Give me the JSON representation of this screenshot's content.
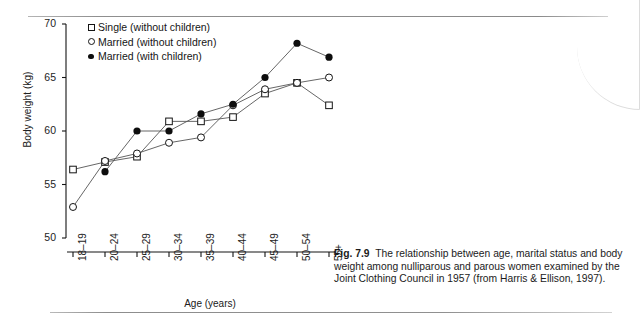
{
  "figure": {
    "number_label": "Fig. 7.9",
    "caption": "The relationship between age, marital status and body weight among nulliparous and parous women examined by the Joint Clothing Council in 1957 (from Harris & Ellison, 1997)."
  },
  "legend": {
    "position": "top-left-inside",
    "items": [
      {
        "marker": "open-square-marker",
        "label": "Single (without children)"
      },
      {
        "marker": "open-circle-marker",
        "label": "Married (without children)"
      },
      {
        "marker": "filled-circle-marker",
        "label": "Married (with children)"
      }
    ]
  },
  "chart_data": {
    "type": "line",
    "title": "",
    "xlabel": "Age (years)",
    "ylabel": "Body weight (kg)",
    "categories": [
      "18–19",
      "20–24",
      "25–29",
      "30–34",
      "35–39",
      "40–44",
      "45–49",
      "50–54",
      "55+"
    ],
    "ylim": [
      50,
      70
    ],
    "yticks": [
      50,
      55,
      60,
      65,
      70
    ],
    "ytick_labels": [
      "50",
      "55",
      "60",
      "65",
      "70"
    ],
    "grid": false,
    "legend_position": "upper left",
    "series": [
      {
        "name": "Single (without children)",
        "marker": "open-square",
        "values": [
          56.4,
          57.1,
          57.6,
          60.9,
          60.9,
          61.3,
          63.5,
          64.5,
          62.4
        ]
      },
      {
        "name": "Married (without children)",
        "marker": "open-circle",
        "values": [
          52.9,
          57.2,
          57.9,
          58.9,
          59.4,
          62.4,
          63.9,
          64.5,
          65.0
        ]
      },
      {
        "name": "Married (with children)",
        "marker": "filled-circle",
        "values": [
          null,
          56.2,
          60.0,
          60.0,
          61.6,
          62.5,
          65.0,
          68.2,
          66.9
        ]
      }
    ]
  },
  "colors": {
    "ink": "#141414",
    "line": "#555555",
    "rule": "#939393",
    "background": "#ffffff"
  }
}
